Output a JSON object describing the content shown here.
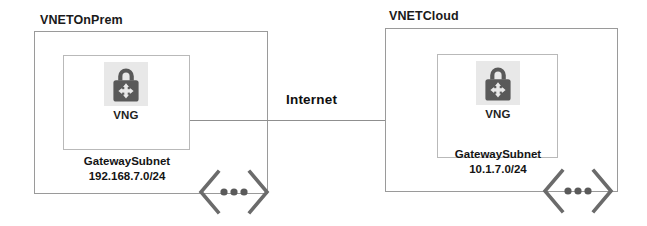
{
  "diagram": {
    "background_color": "#ffffff",
    "line_color": "#8f8f8f",
    "box_border_color": "#9a9a9a",
    "subnet_border_color": "#b9b9b9",
    "icon_color": "#595959",
    "icon_plate_color": "#e8e8e8",
    "text_color": "#141414"
  },
  "connection": {
    "label": "Internet",
    "icon_name": "horizontal-connector-line"
  },
  "networks": [
    {
      "id": "onprem",
      "title": "VNETOnPrem",
      "subnet": {
        "name": "GatewaySubnet",
        "address_prefix": "192.168.7.0/24"
      },
      "gateway": {
        "label": "VNG",
        "icon_name": "vpn-gateway-lock-icon"
      },
      "expand": {
        "icon_name": "expand-chevron-dots-icon",
        "dots": 3
      }
    },
    {
      "id": "cloud",
      "title": "VNETCloud",
      "subnet": {
        "name": "GatewaySubnet",
        "address_prefix": "10.1.7.0/24"
      },
      "gateway": {
        "label": "VNG",
        "icon_name": "vpn-gateway-lock-icon"
      },
      "expand": {
        "icon_name": "expand-chevron-dots-icon",
        "dots": 3
      }
    }
  ]
}
